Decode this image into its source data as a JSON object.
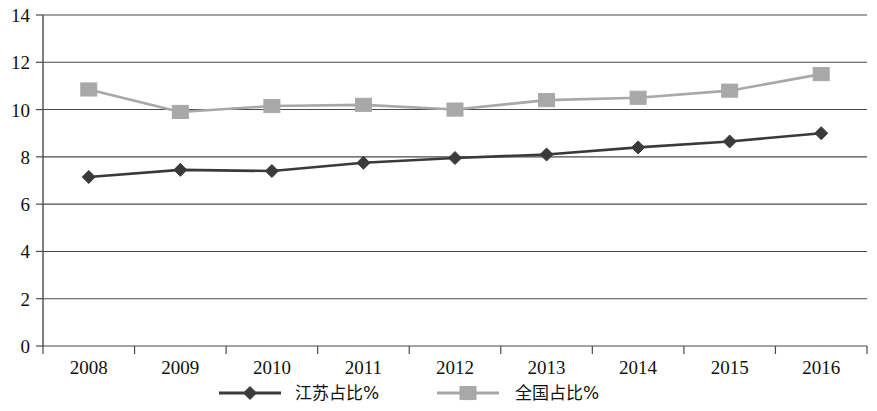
{
  "chart_data": {
    "type": "line",
    "title": "",
    "subtitle": "",
    "xlabel": "",
    "ylabel": "",
    "categories": [
      "2008",
      "2009",
      "2010",
      "2011",
      "2012",
      "2013",
      "2014",
      "2015",
      "2016"
    ],
    "series": [
      {
        "name": "江苏占比%",
        "values": [
          7.15,
          7.45,
          7.4,
          7.75,
          7.95,
          8.1,
          8.4,
          8.65,
          9.0
        ],
        "color": "#3a3a3a",
        "marker": "diamond"
      },
      {
        "name": "全国占比%",
        "values": [
          10.85,
          9.9,
          10.15,
          10.2,
          10.0,
          10.4,
          10.5,
          10.8,
          11.5
        ],
        "color": "#a8a8a8",
        "marker": "square"
      }
    ],
    "ylim": [
      0,
      14
    ],
    "yticks": [
      0,
      2,
      4,
      6,
      8,
      10,
      12,
      14
    ],
    "ytick_labels": [
      "0",
      "2",
      "4",
      "6",
      "8",
      "10",
      "12",
      "14"
    ],
    "grid": true,
    "grid_axis": "y",
    "legend_position": "bottom",
    "legend_entries": [
      "江苏占比%",
      "全国占比%"
    ]
  }
}
